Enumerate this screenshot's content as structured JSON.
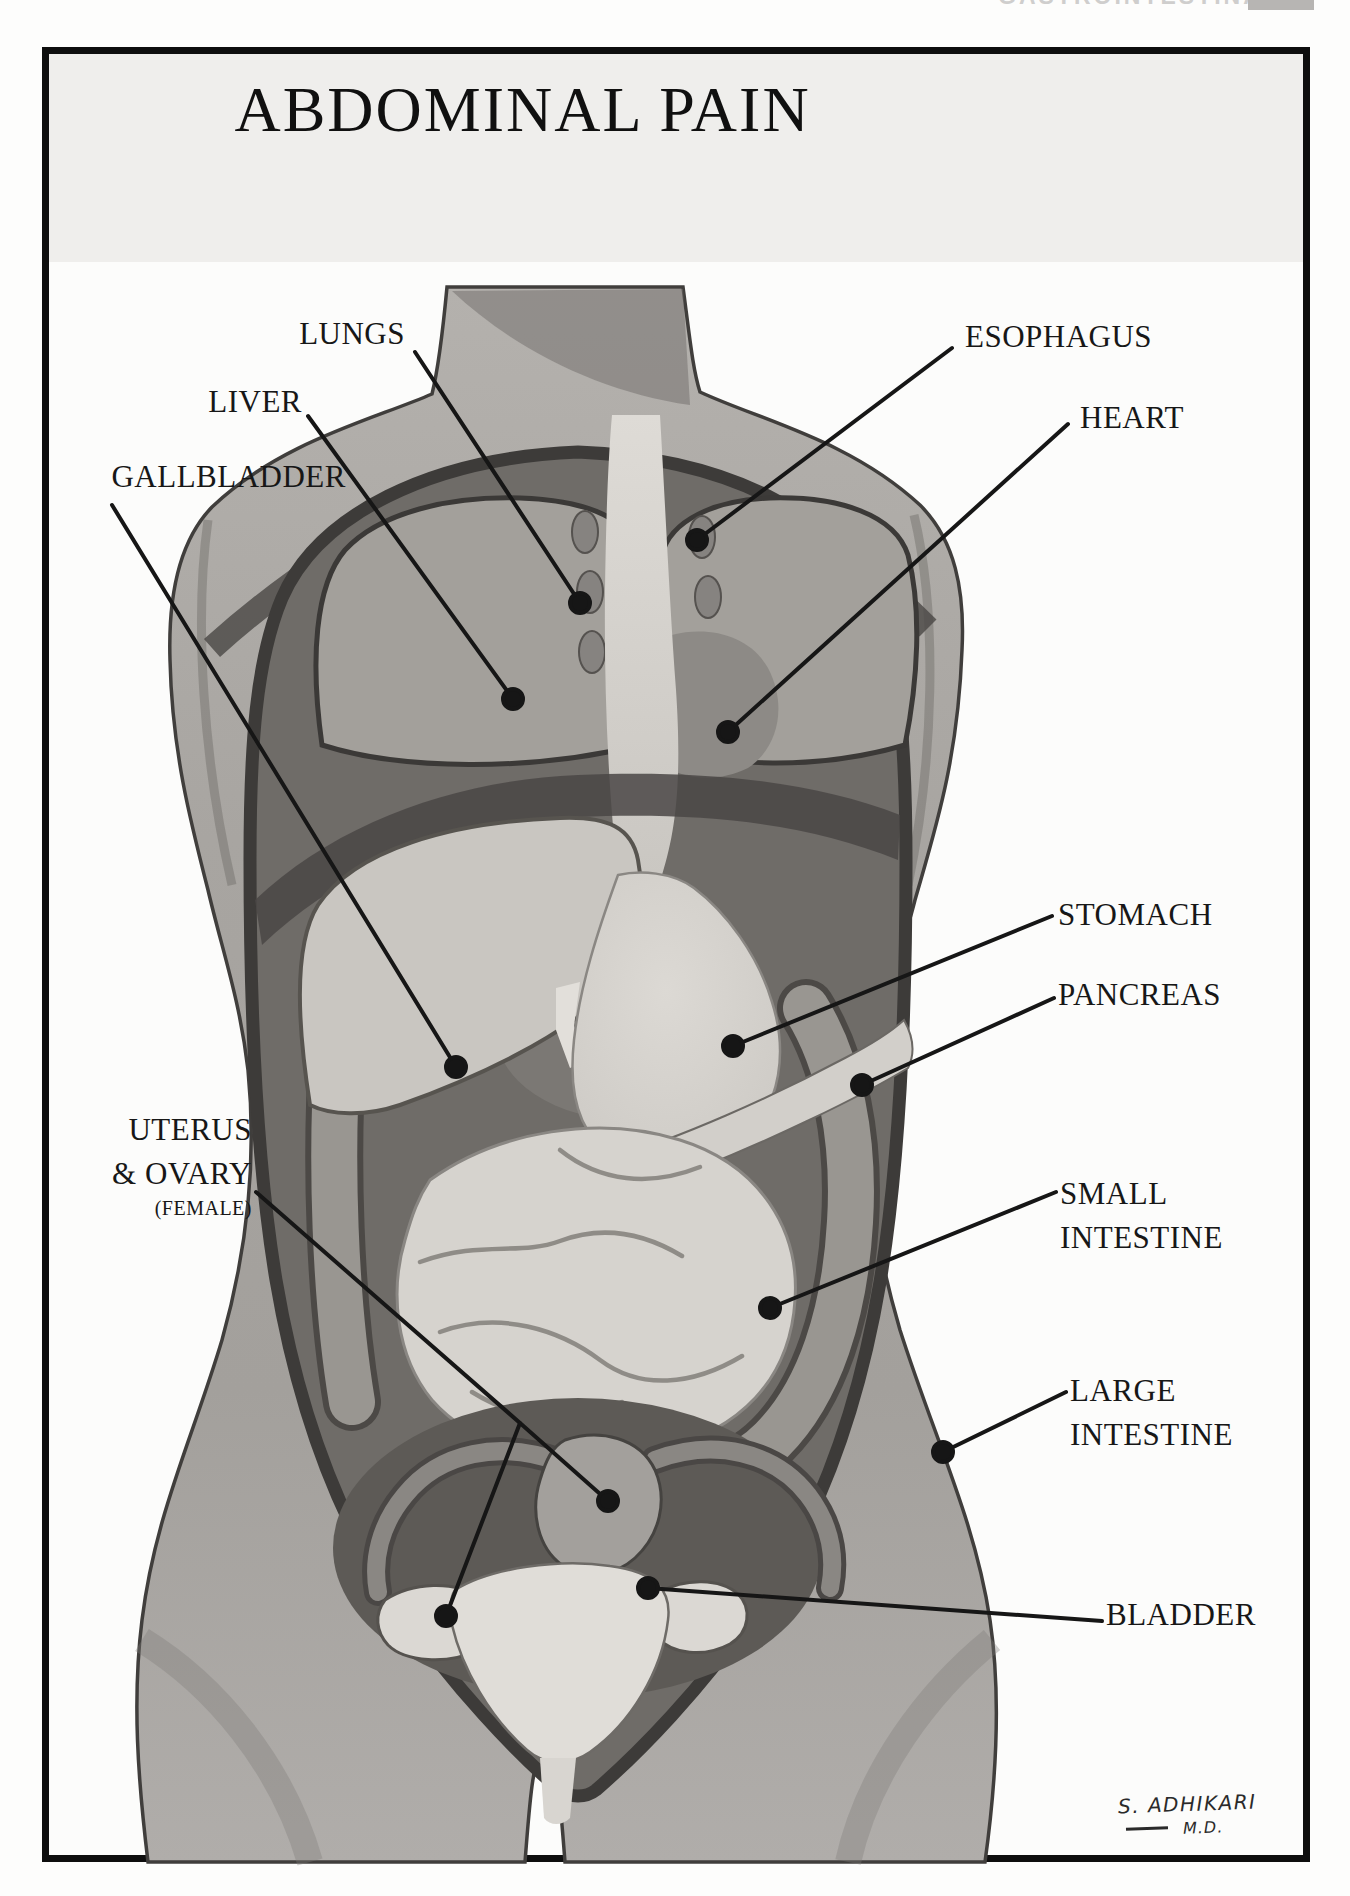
{
  "header": {
    "chapter_label": "GASTROINTESTINAL",
    "page_badge": ""
  },
  "poster": {
    "title": "ABDOMINAL PAIN",
    "labels": {
      "lungs": "LUNGS",
      "liver": "LIVER",
      "gallbladder": "GALLBLADDER",
      "uterus_line1": "UTERUS",
      "uterus_line2": "& OVARY",
      "uterus_sub": "(FEMALE)",
      "esophagus": "ESOPHAGUS",
      "heart": "HEART",
      "stomach": "STOMACH",
      "pancreas": "PANCREAS",
      "small_intestine_line1": "SMALL",
      "small_intestine_line2": "INTESTINE",
      "large_intestine_line1": "LARGE",
      "large_intestine_line2": "INTESTINE",
      "bladder": "BLADDER"
    },
    "signature": {
      "name": "S. ADHIKARI",
      "credential": "M.D."
    },
    "colors": {
      "ink": "#161616",
      "title_band": "#efeeec",
      "body_gray": "#a8a5a1"
    }
  }
}
